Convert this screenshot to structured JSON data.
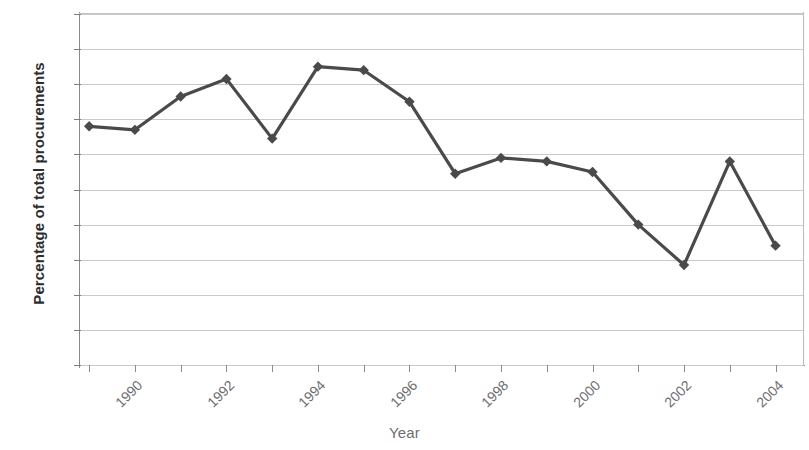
{
  "chart_data": {
    "type": "line",
    "title": "",
    "xlabel": "Year",
    "ylabel": "Percentage of total procurements",
    "xlim": [
      1989.8,
      2005.6
    ],
    "ylim": [
      25,
      45
    ],
    "ytick_step": 2,
    "grid": true,
    "legend": "none",
    "marker": "diamond",
    "series_color": "#4a4a4c",
    "grid_color": "#c9c9cc",
    "axis_color": "#8a8a8d",
    "x": [
      1990,
      1991,
      1992,
      1993,
      1994,
      1995,
      1996,
      1997,
      1998,
      1999,
      2000,
      2001,
      2002,
      2003,
      2004,
      2005
    ],
    "values": [
      38.6,
      38.4,
      40.3,
      41.3,
      37.9,
      42.0,
      41.8,
      40.0,
      35.9,
      36.8,
      36.6,
      36.0,
      33.0,
      30.7,
      36.6,
      31.8
    ],
    "ytick_labels": [
      "45",
      "43",
      "41",
      "39",
      "37",
      "35",
      "33",
      "31",
      "29",
      "27",
      "25"
    ],
    "ytick_values": [
      45,
      43,
      41,
      39,
      37,
      35,
      33,
      31,
      29,
      27,
      25
    ],
    "xtick_values": [
      1990,
      1991,
      1992,
      1993,
      1994,
      1995,
      1996,
      1997,
      1998,
      1999,
      2000,
      2001,
      2002,
      2003,
      2004,
      2005
    ],
    "xtick_labels": [
      "1990",
      "",
      "1992",
      "",
      "1994",
      "",
      "1996",
      "",
      "1998",
      "",
      "2000",
      "",
      "2002",
      "",
      "2004",
      ""
    ]
  }
}
